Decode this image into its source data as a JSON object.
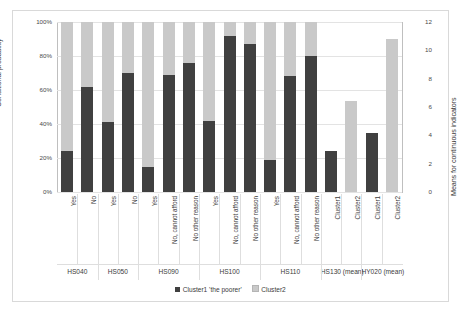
{
  "chart_data": {
    "type": "bar",
    "title": "",
    "subtype": "stacked-100pct-with-secondary-axis",
    "ylabel": "Conditional probability",
    "ylabel_secondary": "Means for continuous indicators",
    "xlabel": "",
    "grid": true,
    "legend_position": "bottom",
    "ylim": [
      0,
      100
    ],
    "ylim_secondary": [
      0,
      12
    ],
    "yticks": [
      "0%",
      "20%",
      "40%",
      "60%",
      "80%",
      "100%"
    ],
    "yticks_secondary": [
      "0",
      "2",
      "4",
      "6",
      "8",
      "10",
      "12"
    ],
    "legend": [
      {
        "label": "Cluster1  'the poorer'",
        "color": "#404040"
      },
      {
        "label": "Cluster2",
        "color": "#c9c9c9"
      }
    ],
    "groups": [
      {
        "name": "HS040",
        "categories": [
          "Yes",
          "No"
        ]
      },
      {
        "name": "HS050",
        "categories": [
          "Yes",
          "No"
        ]
      },
      {
        "name": "HS090",
        "categories": [
          "Yes",
          "No, cannot afford",
          "No other reason"
        ]
      },
      {
        "name": "HS100",
        "categories": [
          "Yes",
          "No, cannot afford",
          "No other reason"
        ]
      },
      {
        "name": "HS110",
        "categories": [
          "Yes",
          "No, cannot afford",
          "No other reason"
        ]
      },
      {
        "name": "HS130 (mean)",
        "categories": [
          "Cluster1",
          "Cluster2"
        ]
      },
      {
        "name": "HY020 (mean)",
        "categories": [
          "Cluster1",
          "Cluster2"
        ]
      }
    ],
    "categories": [
      "Yes",
      "No",
      "Yes",
      "No",
      "Yes",
      "No, cannot afford",
      "No other reason",
      "Yes",
      "No, cannot afford",
      "No other reason",
      "Yes",
      "No, cannot afford",
      "No other reason",
      "Cluster1",
      "Cluster2",
      "Cluster1",
      "Cluster2"
    ],
    "series": [
      {
        "name": "Cluster1  'the poorer'",
        "axis": "primary",
        "values": [
          24,
          62,
          41,
          70,
          15,
          69,
          76,
          42,
          92,
          87,
          19,
          68,
          80,
          null,
          null,
          null,
          null
        ]
      },
      {
        "name": "Cluster2",
        "axis": "primary",
        "values": [
          76,
          38,
          59,
          30,
          85,
          31,
          24,
          58,
          8,
          13,
          81,
          32,
          20,
          null,
          null,
          null,
          null
        ]
      }
    ],
    "secondary_bars": [
      {
        "group": "HS130 (mean)",
        "category": "Cluster1",
        "series": "Cluster1  'the poorer'",
        "value": 2.9
      },
      {
        "group": "HS130 (mean)",
        "category": "Cluster2",
        "series": "Cluster2",
        "value": 6.4
      },
      {
        "group": "HY020 (mean)",
        "category": "Cluster1",
        "series": "Cluster1  'the poorer'",
        "value": 4.2
      },
      {
        "group": "HY020 (mean)",
        "category": "Cluster2",
        "series": "Cluster2",
        "value": 10.8
      }
    ],
    "colors": {
      "cluster1": "#404040",
      "cluster2": "#c9c9c9",
      "grid": "#e3e3e3",
      "axis": "#bfbfbf",
      "text": "#3b3b3b",
      "background": "#ffffff"
    }
  }
}
